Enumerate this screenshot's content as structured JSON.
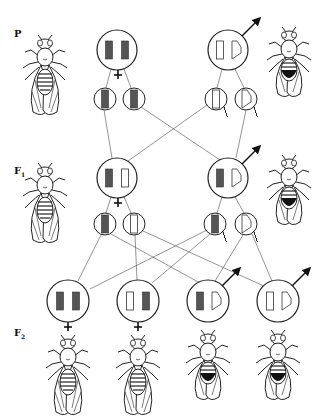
{
  "diagram": {
    "type": "genetic-cross",
    "colors": {
      "line": "#333333",
      "chromosome_filled": "#555555",
      "chromosome_empty": "#ffffff",
      "background": "#ffffff"
    },
    "generations": [
      {
        "label": "P",
        "sub": "",
        "female": {
          "symbol": "♀",
          "chromosomes": [
            "X-filled",
            "X-filled"
          ],
          "gametes": [
            "X-filled",
            "X-filled"
          ],
          "phenotype": "red-eye female"
        },
        "male": {
          "symbol": "♂",
          "chromosomes": [
            "X-empty",
            "Y"
          ],
          "gametes": [
            "X-empty",
            "Y"
          ],
          "phenotype": "white-eye male"
        }
      },
      {
        "label": "F",
        "sub": "1",
        "female": {
          "symbol": "♀",
          "chromosomes": [
            "X-filled",
            "X-empty"
          ],
          "gametes": [
            "X-filled",
            "X-empty"
          ],
          "phenotype": "red-eye female"
        },
        "male": {
          "symbol": "♂",
          "chromosomes": [
            "X-filled",
            "Y"
          ],
          "gametes": [
            "X-filled",
            "Y"
          ],
          "phenotype": "red-eye male"
        }
      },
      {
        "label": "F",
        "sub": "2",
        "offspring": [
          {
            "symbol": "♀",
            "chromosomes": [
              "X-filled",
              "X-filled"
            ],
            "phenotype": "red-eye female"
          },
          {
            "symbol": "♀",
            "chromosomes": [
              "X-empty",
              "X-filled"
            ],
            "phenotype": "red-eye female"
          },
          {
            "symbol": "♂",
            "chromosomes": [
              "X-filled",
              "Y"
            ],
            "phenotype": "red-eye male"
          },
          {
            "symbol": "♂",
            "chromosomes": [
              "X-empty",
              "Y"
            ],
            "phenotype": "white-eye male"
          }
        ]
      }
    ]
  }
}
